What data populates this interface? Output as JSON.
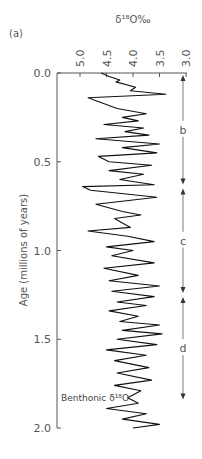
{
  "chart_data": {
    "type": "line",
    "panel_label": "(a)",
    "title": "",
    "xlabel": "δ¹⁸O‰",
    "ylabel": "Age (millions of years)",
    "x_axis_position": "top",
    "x_reversed": true,
    "xlim": [
      5.0,
      3.0
    ],
    "ylim": [
      0.0,
      2.0
    ],
    "y_reversed": true,
    "xticks": [
      5.0,
      4.5,
      4.0,
      3.5,
      3.0
    ],
    "xtick_labels": [
      "5.0",
      "4.5",
      "4.0",
      "3.5",
      "3.0"
    ],
    "yticks": [
      0.0,
      0.5,
      1.0,
      1.5,
      2.0
    ],
    "ytick_labels": [
      "0.0",
      "0.5",
      "1.0",
      "1.5",
      "2.0"
    ],
    "grid": false,
    "series": [
      {
        "name": "Benthonic δ18O",
        "annotation": "Benthonic δ¹⁸O",
        "age": [
          0.0,
          0.02,
          0.04,
          0.05,
          0.08,
          0.1,
          0.12,
          0.14,
          0.2,
          0.23,
          0.25,
          0.27,
          0.29,
          0.31,
          0.33,
          0.35,
          0.37,
          0.4,
          0.42,
          0.45,
          0.47,
          0.5,
          0.52,
          0.55,
          0.57,
          0.6,
          0.63,
          0.64,
          0.66,
          0.7,
          0.74,
          0.78,
          0.8,
          0.82,
          0.87,
          0.89,
          0.92,
          0.95,
          0.98,
          1.0,
          1.03,
          1.07,
          1.1,
          1.14,
          1.17,
          1.2,
          1.23,
          1.26,
          1.29,
          1.31,
          1.34,
          1.37,
          1.4,
          1.42,
          1.45,
          1.47,
          1.5,
          1.53,
          1.56,
          1.59,
          1.62,
          1.66,
          1.69,
          1.73,
          1.76,
          1.79,
          1.83,
          1.86,
          1.89,
          1.92,
          1.95,
          1.98,
          2.0
        ],
        "d18O": [
          4.6,
          4.45,
          4.25,
          4.32,
          3.95,
          4.05,
          3.38,
          4.85,
          4.3,
          3.75,
          4.2,
          3.9,
          4.55,
          3.8,
          4.15,
          3.7,
          4.7,
          3.5,
          4.2,
          3.55,
          4.65,
          4.45,
          3.65,
          4.45,
          3.8,
          4.25,
          3.6,
          4.95,
          4.8,
          3.55,
          4.7,
          4.2,
          3.85,
          4.35,
          4.05,
          4.85,
          4.1,
          3.6,
          4.5,
          4.0,
          4.4,
          3.6,
          4.55,
          3.9,
          4.45,
          3.5,
          4.4,
          3.6,
          4.3,
          3.75,
          4.45,
          3.9,
          4.25,
          3.5,
          4.2,
          3.45,
          4.3,
          3.55,
          4.5,
          3.75,
          4.35,
          3.7,
          4.3,
          3.65,
          4.35,
          3.85,
          4.1,
          3.9,
          4.5,
          3.75,
          4.2,
          3.5,
          4.0
        ]
      }
    ],
    "segments": [
      {
        "label": "b",
        "from": 0.0,
        "to": 0.64
      },
      {
        "label": "c",
        "from": 0.64,
        "to": 1.25
      },
      {
        "label": "d",
        "from": 1.25,
        "to": 1.85
      }
    ]
  }
}
